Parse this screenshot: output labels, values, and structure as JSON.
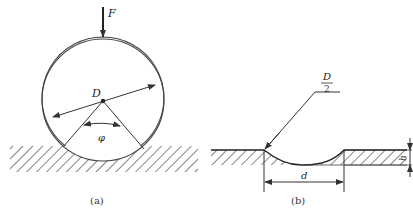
{
  "figure_a": {
    "force_label": "F",
    "diameter_label": "D",
    "angle_label": "φ",
    "caption": "(a)"
  },
  "figure_b": {
    "radius_label_num": "D",
    "radius_label_den": "2",
    "width_label": "d",
    "depth_label": "h",
    "caption": "(b)"
  },
  "colors": {
    "line": "#333333",
    "background": "#ffffff"
  }
}
